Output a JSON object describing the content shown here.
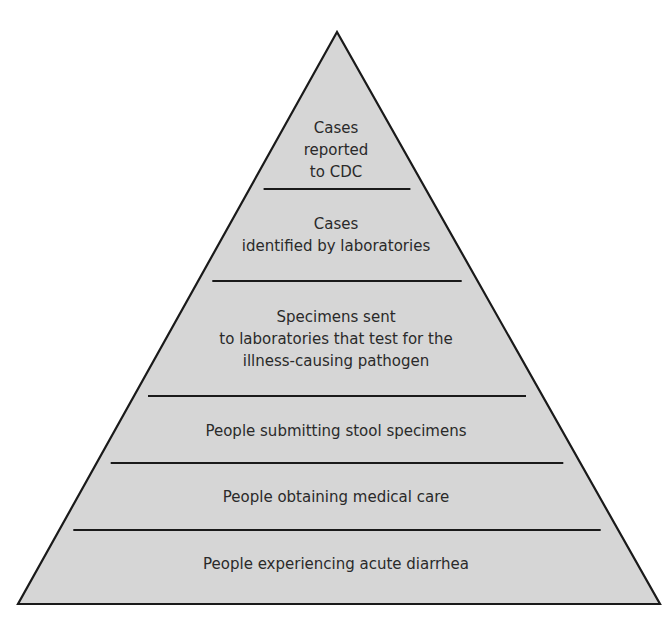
{
  "diagram": {
    "type": "pyramid",
    "colors": {
      "fill": "#d6d6d6",
      "stroke": "#1a1a1a",
      "text": "#2a2a2a",
      "background": "#ffffff"
    },
    "tiers": [
      {
        "label": "Cases\nreported\nto CDC"
      },
      {
        "label": "Cases\nidentified by laboratories"
      },
      {
        "label": "Specimens sent\nto laboratories that test for the\nillness-causing pathogen"
      },
      {
        "label": "People submitting stool specimens"
      },
      {
        "label": "People obtaining medical care"
      },
      {
        "label": "People experiencing acute diarrhea"
      }
    ]
  }
}
